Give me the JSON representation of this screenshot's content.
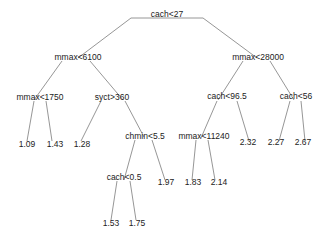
{
  "diagram": {
    "type": "regression-tree",
    "nodes": {
      "root": {
        "label": "cach<27"
      },
      "n_left": {
        "label": "mmax<6100"
      },
      "n_right": {
        "label": "mmax<28000"
      },
      "n_ll": {
        "label": "mmax<1750"
      },
      "n_lr": {
        "label": "syct>360"
      },
      "n_lrr": {
        "label": "chmin<5.5"
      },
      "n_lrrl": {
        "label": "cach<0.5"
      },
      "n_rl": {
        "label": "cach<96.5"
      },
      "n_rr": {
        "label": "cach<56"
      },
      "n_rll": {
        "label": "mmax<11240"
      }
    },
    "leaves": {
      "l1": {
        "value": "1.09"
      },
      "l2": {
        "value": "1.43"
      },
      "l3": {
        "value": "1.28"
      },
      "l4": {
        "value": "1.53"
      },
      "l5": {
        "value": "1.75"
      },
      "l6": {
        "value": "1.97"
      },
      "l7": {
        "value": "1.83"
      },
      "l8": {
        "value": "2.14"
      },
      "l9": {
        "value": "2.32"
      },
      "l10": {
        "value": "2.27"
      },
      "l11": {
        "value": "2.67"
      }
    },
    "edge_color": "#8a8a8a"
  }
}
